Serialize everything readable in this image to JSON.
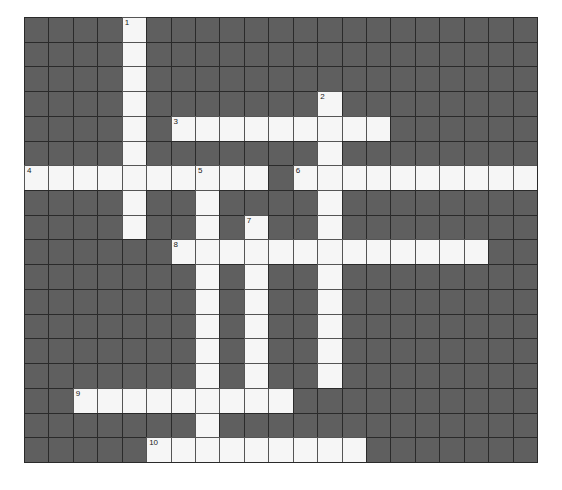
{
  "puzzle": {
    "cols": 21,
    "rows": 18,
    "colors": {
      "block": "#5f5f5f",
      "open": "#f6f6f6",
      "gridline": "#2a2a2a"
    },
    "entries": [
      {
        "number": "1",
        "direction": "down",
        "row": 0,
        "col": 4,
        "length": 9
      },
      {
        "number": "2",
        "direction": "down",
        "row": 3,
        "col": 12,
        "length": 12
      },
      {
        "number": "3",
        "direction": "across",
        "row": 4,
        "col": 6,
        "length": 9
      },
      {
        "number": "4",
        "direction": "across",
        "row": 6,
        "col": 0,
        "length": 10
      },
      {
        "number": "5",
        "direction": "down",
        "row": 6,
        "col": 7,
        "length": 12
      },
      {
        "number": "6",
        "direction": "across",
        "row": 6,
        "col": 11,
        "length": 10
      },
      {
        "number": "7",
        "direction": "down",
        "row": 8,
        "col": 9,
        "length": 8
      },
      {
        "number": "8",
        "direction": "across",
        "row": 9,
        "col": 6,
        "length": 13
      },
      {
        "number": "9",
        "direction": "across",
        "row": 15,
        "col": 2,
        "length": 9
      },
      {
        "number": "10",
        "direction": "across",
        "row": 17,
        "col": 5,
        "length": 9
      }
    ]
  }
}
